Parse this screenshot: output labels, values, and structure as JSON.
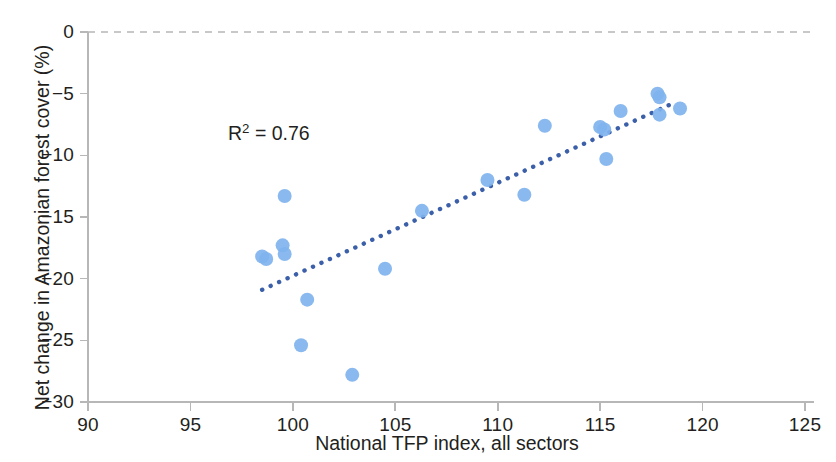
{
  "chart_data": {
    "type": "scatter",
    "title": "",
    "subtitle": "",
    "xlabel": "National TFP index, all sectors",
    "ylabel": "Net change in Amazonian forest cover (%)",
    "xlim": [
      90,
      125
    ],
    "ylim": [
      -30,
      0
    ],
    "xticks": [
      90,
      95,
      100,
      105,
      110,
      115,
      120,
      125
    ],
    "yticks": [
      0,
      -5,
      -10,
      -15,
      -20,
      -25,
      -30
    ],
    "xtick_labels": [
      "90",
      "95",
      "100",
      "105",
      "110",
      "115",
      "120",
      "125"
    ],
    "ytick_labels": [
      "0",
      "−5",
      "−10",
      "−15",
      "−20",
      "−25",
      "−30"
    ],
    "grid": false,
    "legend": null,
    "annotations": [
      {
        "name": "r-squared",
        "text": "R² = 0.76",
        "text_base": "R",
        "text_sup": "2",
        "text_rest": " = 0.76",
        "x": 97,
        "y": -11.3
      }
    ],
    "reference_lines": [
      {
        "name": "zero-line",
        "orientation": "horizontal",
        "value": 0,
        "style": "dashed",
        "color": "#c8c8c8"
      }
    ],
    "series": [
      {
        "name": "observations",
        "type": "scatter",
        "marker": "circle",
        "marker_size": 14,
        "color": "#7fb3ee",
        "points": [
          {
            "x": 98.5,
            "y": -18.2
          },
          {
            "x": 98.7,
            "y": -18.4
          },
          {
            "x": 99.5,
            "y": -17.3
          },
          {
            "x": 99.6,
            "y": -18.0
          },
          {
            "x": 99.6,
            "y": -13.3
          },
          {
            "x": 100.4,
            "y": -25.4
          },
          {
            "x": 100.7,
            "y": -21.7
          },
          {
            "x": 102.9,
            "y": -27.8
          },
          {
            "x": 104.5,
            "y": -19.2
          },
          {
            "x": 106.3,
            "y": -14.5
          },
          {
            "x": 109.5,
            "y": -12.0
          },
          {
            "x": 111.3,
            "y": -13.2
          },
          {
            "x": 112.3,
            "y": -7.6
          },
          {
            "x": 115.0,
            "y": -7.7
          },
          {
            "x": 115.2,
            "y": -7.9
          },
          {
            "x": 115.3,
            "y": -10.3
          },
          {
            "x": 116.0,
            "y": -6.4
          },
          {
            "x": 117.8,
            "y": -5.0
          },
          {
            "x": 117.9,
            "y": -5.3
          },
          {
            "x": 117.9,
            "y": -6.7
          },
          {
            "x": 118.9,
            "y": -6.2
          }
        ]
      }
    ],
    "trendline": {
      "name": "linear-fit",
      "style": "dotted",
      "color": "#3b5fa8",
      "r_squared": 0.76,
      "x_start": 98.5,
      "y_start": -20.9,
      "x_end": 118.4,
      "y_end": -5.9
    }
  }
}
